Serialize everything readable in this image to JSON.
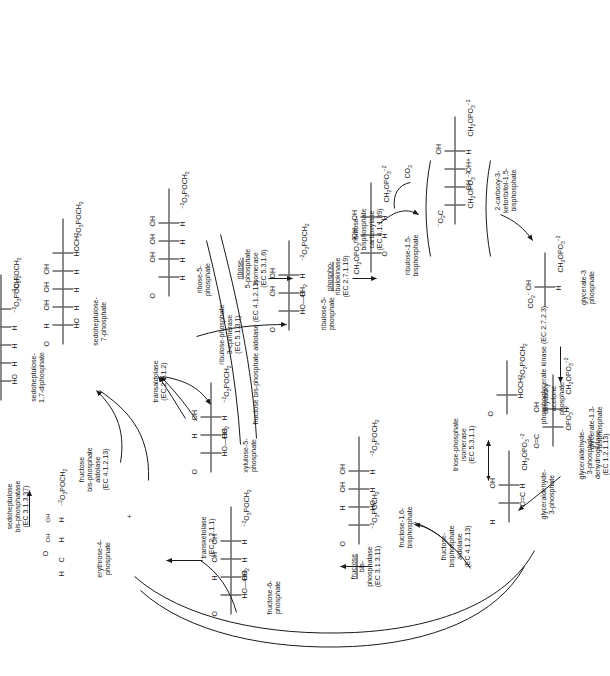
{
  "figure": {
    "type": "biochemical-pathway-diagram",
    "orientation": "page rotated 90 degrees counter-clockwise; text reads bottom-to-top",
    "background": "#ffffff",
    "ink": "#1a1a1a"
  },
  "metabolites": [
    {
      "id": "e4p",
      "name": "erythrose-4-\nphosphate"
    },
    {
      "id": "shdp",
      "name": "sedoheptulose-\n1,7-diphosphate"
    },
    {
      "id": "sh7p",
      "name": "sedoheptulose-\n7-phosphate"
    },
    {
      "id": "r5p",
      "name": "ribose-5-\nphosphate"
    },
    {
      "id": "ru5p",
      "name": "ribulose-5-\nphosphate"
    },
    {
      "id": "xu5p",
      "name": "xylulose-5-\nphosphate"
    },
    {
      "id": "f6p",
      "name": "fructose-6-\nphosphate"
    },
    {
      "id": "fbp",
      "name": "fructose-1,6-\nbisphosphate"
    },
    {
      "id": "rubp",
      "name": "ribulose-1,5-\nbisphosphate"
    },
    {
      "id": "ckb",
      "name": "2-carboxy-3-\nketoribitol-1,5-\nbisphosphate"
    },
    {
      "id": "g3p",
      "name": "glyceraldehyde-\n3-phosphate"
    },
    {
      "id": "dhap",
      "name": "dihydroxy\nacetone\nphosphate"
    },
    {
      "id": "bpg",
      "name": "glycerate-1,3-\nbisphosphate"
    },
    {
      "id": "pga",
      "name": "glycerate-3\nphosphate"
    },
    {
      "id": "co2",
      "name": "CO2"
    }
  ],
  "enzymes": [
    {
      "id": "fba1",
      "name": "fructose\nbis-phosphate\naldolase",
      "ec": "(EC 4.1.2.13)"
    },
    {
      "id": "shbp",
      "name": "sedoheptulose\nbis-phosphatase",
      "ec": "(EC 3.1.3.37)"
    },
    {
      "id": "ta",
      "name": "transaldolase",
      "ec": "(EC 2.2.1.2)"
    },
    {
      "id": "tk",
      "name": "transketolase",
      "ec": "(EC 2.2.1.1)"
    },
    {
      "id": "rpe",
      "name": "ribulose-phosphate\n3-epimerase",
      "ec": "(EC 5.1.3.1)"
    },
    {
      "id": "rpi",
      "name": "ribose-\n5-phosphate\nisomerase",
      "ec": "(EC 5.3.1.6)"
    },
    {
      "id": "prk",
      "name": "phospho-\nribulokinase",
      "ec": "(EC 2.7.1.19)"
    },
    {
      "id": "rbc",
      "name": "ribulose-\nbisphosphate\ncarboxylase",
      "ec": "(EC 4.1.1.39)"
    },
    {
      "id": "fbpase",
      "name": "fructose\nbis-\nphosphatase",
      "ec": "(EC 3.1.3.11)"
    },
    {
      "id": "fba2",
      "name": "fructose-\nbisphosphate\naldolase",
      "ec": "(EC 4.1.2.13)"
    },
    {
      "id": "fba3",
      "name": "fructose bis-phosphate aldolase",
      "ec": "(EC 4.1.2.13)"
    },
    {
      "id": "tpi",
      "name": "triose-phosphate\nisomerase",
      "ec": "(EC 5.3.1.1)"
    },
    {
      "id": "gapdh",
      "name": "glyceraldehyde-\n3-phosphate\ndehydrogenase",
      "ec": "(EC 1.2.1.13)"
    },
    {
      "id": "pgk",
      "name": "phosphoglycerate kinase",
      "ec": "(EC 2.7.2.3)"
    }
  ],
  "structures": {
    "e4p": [
      "H",
      "O",
      "H  OH",
      "H  OH",
      "-2O3POCH2"
    ],
    "shdp": [
      "O",
      "HO  H",
      "H  OH",
      "H  OH",
      "H  OH",
      "-2O3POCH2",
      "-2O3POCH2"
    ],
    "sh7p": [
      "O",
      "HO  H",
      "H  OH",
      "H  OH",
      "H  OH",
      "HOCH2",
      "-2O3POCH2"
    ],
    "r5p": [
      "O",
      "H",
      "H  OH",
      "H  OH",
      "H  OH",
      "-2O3POCH2"
    ],
    "ru5p": [
      "O",
      "HO-CH2",
      "H  OH",
      "H  OH",
      "-2O3POCH2"
    ],
    "xu5p": [
      "O",
      "HO-CH2",
      "HO  H",
      "H  OH",
      "-2O3POCH2"
    ],
    "f6p": [
      "O",
      "HO-CH2",
      "HO  H",
      "H  OH",
      "H  OH",
      "-2O3POCH2"
    ],
    "fbp": [
      "O",
      "-2O3POCH2",
      "HO  H",
      "H  OH",
      "H  OH",
      "-2O3POCH2"
    ],
    "rubp": [
      "CH2OPO3-2",
      "O",
      "H  OH",
      "H  OH",
      "CH2OPO3-2"
    ],
    "ckb": [
      "-O2C",
      "CH2OPO3-2",
      "OH",
      "OH+",
      "H  OH",
      "CH2OPO3-2"
    ],
    "g3p": [
      "H",
      "O=C",
      "H  OH",
      "CH2OPO3-2"
    ],
    "dhap": [
      "O",
      "HOCH2",
      "-2O3POCH2"
    ],
    "bpg": [
      "O=C",
      "OPO3-2",
      "H  OH",
      "CH2OPO3-2"
    ],
    "pga": [
      "CO2-",
      "H  OH",
      "CH2OPO3-2"
    ]
  },
  "cofactors": [
    {
      "id": "co2-in",
      "label": "CO2"
    }
  ],
  "connector_labels": {
    "plus_sign": "+"
  }
}
